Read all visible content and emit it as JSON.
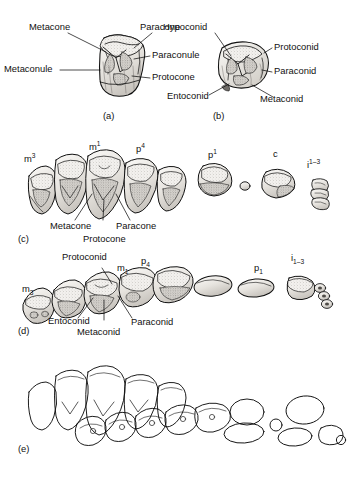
{
  "figure": {
    "title_visible": false,
    "style": "pen-and-ink stippled anatomical illustration",
    "background_color": "#ffffff",
    "ink_color": "#111111",
    "panels": [
      {
        "letter": "(a)",
        "subject": "upper molar, occlusal-oblique view",
        "labels": [
          {
            "text": "Metacone",
            "leader": "diagonal"
          },
          {
            "text": "Paracone",
            "leader": "diagonal"
          },
          {
            "text": "Paraconule",
            "leader": "horizontal-dash"
          },
          {
            "text": "Protocone",
            "leader": "horizontal-dash"
          },
          {
            "text": "Metaconule",
            "leader": "horizontal-dash"
          }
        ]
      },
      {
        "letter": "(b)",
        "subject": "lower molar, occlusal-oblique view",
        "labels": [
          {
            "text": "Hypoconid",
            "leader": "diagonal"
          },
          {
            "text": "Protoconid",
            "leader": "horizontal-dash"
          },
          {
            "text": "Paraconid",
            "leader": "horizontal-dash"
          },
          {
            "text": "Entoconid",
            "leader": "diagonal"
          },
          {
            "text": "Metaconid",
            "leader": "diagonal"
          }
        ]
      },
      {
        "letter": "(c)",
        "subject": "upper tooth row, lateral view",
        "tooth_ids": [
          {
            "base": "m",
            "position": "3",
            "notation": "superscript"
          },
          {
            "base": "m",
            "position": "1",
            "notation": "superscript"
          },
          {
            "base": "p",
            "position": "4",
            "notation": "superscript"
          },
          {
            "base": "p",
            "position": "1",
            "notation": "superscript"
          },
          {
            "base": "c",
            "position": "",
            "notation": "none"
          },
          {
            "base": "i",
            "position": "1–3",
            "notation": "superscript"
          }
        ],
        "labels": [
          {
            "text": "Metacone",
            "leader": "diagonal"
          },
          {
            "text": "Protocone",
            "leader": "diagonal"
          },
          {
            "text": "Paracone",
            "leader": "diagonal"
          }
        ]
      },
      {
        "letter": "(d)",
        "subject": "lower tooth row, lateral view",
        "tooth_ids": [
          {
            "base": "m",
            "position": "3",
            "notation": "subscript"
          },
          {
            "base": "m",
            "position": "1",
            "notation": "subscript"
          },
          {
            "base": "p",
            "position": "4",
            "notation": "subscript"
          },
          {
            "base": "p",
            "position": "1",
            "notation": "subscript"
          },
          {
            "base": "i",
            "position": "1–3",
            "notation": "subscript"
          }
        ],
        "labels": [
          {
            "text": "Protoconid",
            "leader": "diagonal"
          },
          {
            "text": "Entoconid",
            "leader": "diagonal"
          },
          {
            "text": "Metaconid",
            "leader": "diagonal"
          },
          {
            "text": "Paraconid",
            "leader": "diagonal"
          }
        ]
      },
      {
        "letter": "(e)",
        "subject": "upper and lower tooth rows in occlusion, outline only",
        "tooth_ids": [],
        "labels": []
      }
    ]
  },
  "panel_a": {
    "letter": "(a)",
    "metacone": "Metacone",
    "paracone": "Paracone",
    "paraconule": "Paraconule",
    "protocone": "Protocone",
    "metaconule": "Metaconule"
  },
  "panel_b": {
    "letter": "(b)",
    "hypoconid": "Hypoconid",
    "protoconid": "Protoconid",
    "paraconid": "Paraconid",
    "entoconid": "Entoconid",
    "metaconid": "Metaconid"
  },
  "panel_c": {
    "letter": "(c)",
    "m3": "m",
    "m3_sup": "3",
    "m1": "m",
    "m1_sup": "1",
    "p4": "p",
    "p4_sup": "4",
    "p1": "p",
    "p1_sup": "1",
    "c": "c",
    "i13": "i",
    "i13_sup": "1–3",
    "metacone": "Metacone",
    "protocone": "Protocone",
    "paracone": "Paracone"
  },
  "panel_d": {
    "letter": "(d)",
    "m3": "m",
    "m3_sub": "3",
    "m1": "m",
    "m1_sub": "1",
    "p4": "p",
    "p4_sub": "4",
    "p1": "p",
    "p1_sub": "1",
    "i13": "i",
    "i13_sub": "1–3",
    "protoconid": "Protoconid",
    "entoconid": "Entoconid",
    "metaconid": "Metaconid",
    "paraconid": "Paraconid"
  },
  "panel_e": {
    "letter": "(e)"
  }
}
